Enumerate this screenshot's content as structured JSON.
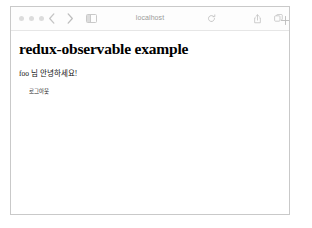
{
  "window": {
    "traffic_lights": [
      "close",
      "minimize",
      "zoom"
    ],
    "toolbar": {
      "back_icon": "chevron-left-icon",
      "forward_icon": "chevron-right-icon",
      "sidebar_icon": "sidebar-toggle-icon",
      "address_title": "localhost",
      "reload_icon": "reload-icon",
      "share_icon": "share-icon",
      "tabs_icon": "show-tabs-icon",
      "newtab_icon": "plus-icon"
    }
  },
  "page": {
    "heading": "redux-observable example",
    "greeting": "foo 님 안녕하세요!",
    "logout_label": "로그아웃"
  }
}
